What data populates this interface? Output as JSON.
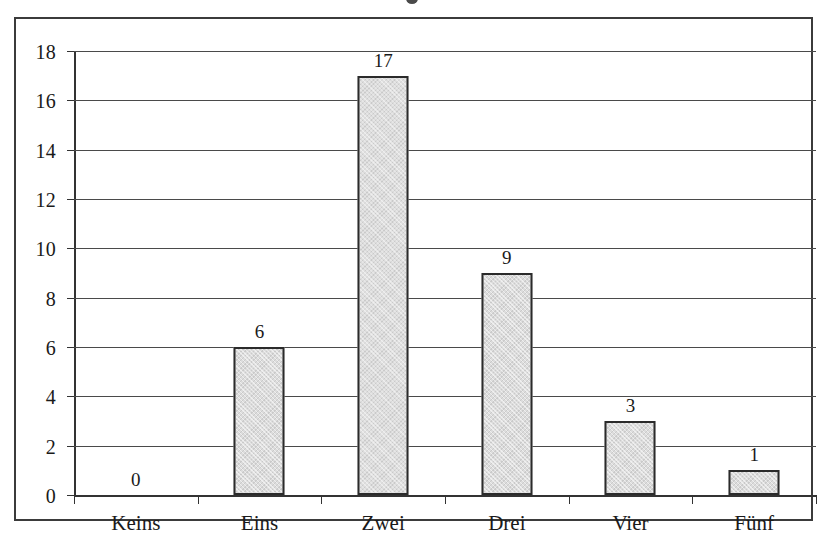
{
  "chart_data": {
    "type": "bar",
    "title": "",
    "xlabel": "",
    "ylabel": "",
    "categories": [
      "Keins",
      "Eins",
      "Zwei",
      "Drei",
      "Vier",
      "Fünf"
    ],
    "values": [
      0,
      6,
      17,
      9,
      3,
      1
    ],
    "data_labels": [
      "0",
      "6",
      "17",
      "9",
      "3",
      "1"
    ],
    "ylim": [
      0,
      18
    ],
    "ytick_values": [
      0,
      2,
      4,
      6,
      8,
      10,
      12,
      14,
      16,
      18
    ],
    "ytick_labels": [
      "0",
      "2",
      "4",
      "6",
      "8",
      "10",
      "12",
      "14",
      "16",
      "18"
    ],
    "grid": "horizontal",
    "legend": "none",
    "bar_fill_color": "#dcdcdc",
    "bar_border_color": "#2b2b2b",
    "gridline_color": "#4a4a4a",
    "axis_color": "#333333",
    "frame_color": "#3b3b3b",
    "background_color": "#ffffff"
  }
}
